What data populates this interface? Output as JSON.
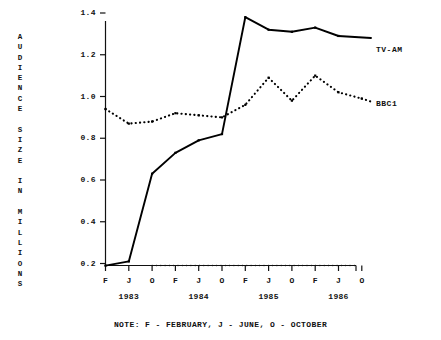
{
  "chart_data": {
    "type": "line",
    "title": "",
    "xlabel": "",
    "ylabel": "AUDIENCE SIZE IN MILLIONS",
    "ylabel_chars": "A\nU\nD\nI\nE\nN\nC\nE\n\nS\nI\nZ\nE\n\nI\nN\n\nM\nI\nL\nL\nI\nO\nN\nS",
    "ylim": [
      0.2,
      1.4
    ],
    "yticks": [
      "1.4",
      "1.2",
      "1.0",
      "0.8",
      "0.6",
      "0.4",
      "0.2"
    ],
    "ytick_values": [
      1.4,
      1.2,
      1.0,
      0.8,
      0.6,
      0.4,
      0.2
    ],
    "grid": false,
    "legend_position": "right-inline",
    "x": [
      "F",
      "J",
      "O",
      "F",
      "J",
      "O",
      "F",
      "J",
      "O",
      "F",
      "J",
      "O"
    ],
    "xtick_labels": [
      "F",
      "J",
      "O",
      "F",
      "J",
      "O",
      "F",
      "J",
      "O",
      "F",
      "J",
      "O"
    ],
    "year_groups": [
      {
        "label": "1983",
        "start_index": 0
      },
      {
        "label": "1984",
        "start_index": 3
      },
      {
        "label": "1985",
        "start_index": 6
      },
      {
        "label": "1986",
        "start_index": 9
      }
    ],
    "series": [
      {
        "name": "TV-AM",
        "style": "solid",
        "color": "#000000",
        "values": [
          0.19,
          0.21,
          0.63,
          0.73,
          0.79,
          0.82,
          1.38,
          1.32,
          1.31,
          1.33,
          1.29,
          null
        ]
      },
      {
        "name": "BBC1",
        "style": "dotted",
        "color": "#000000",
        "values": [
          0.94,
          0.87,
          0.88,
          0.92,
          0.91,
          0.9,
          0.96,
          1.09,
          0.98,
          1.1,
          1.02,
          0.99
        ]
      }
    ],
    "note": "NOTE:  F - FEBRUARY, J - JUNE, O - OCTOBER"
  },
  "labels": {
    "tvam": "TV-AM",
    "bbc1": "BBC1"
  }
}
